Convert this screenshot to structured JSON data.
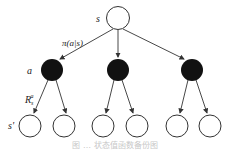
{
  "diagram": {
    "type": "backup-tree",
    "labels": {
      "root_state": "s",
      "policy_edge": "π(a|s)",
      "action": "a",
      "reward": "R",
      "reward_sub": "s",
      "reward_sup": "a",
      "next_state": "s'"
    },
    "caption": "图 … 状态值函数备份图",
    "colors": {
      "state_fill": "#ffffff",
      "action_fill": "#111111",
      "stroke": "#333333"
    },
    "nodes": {
      "root": {
        "kind": "state",
        "label": "s"
      },
      "actions": [
        {
          "kind": "action"
        },
        {
          "kind": "action"
        },
        {
          "kind": "action"
        }
      ],
      "next_states": [
        {
          "kind": "state"
        },
        {
          "kind": "state"
        },
        {
          "kind": "state"
        },
        {
          "kind": "state"
        },
        {
          "kind": "state"
        },
        {
          "kind": "state"
        }
      ]
    }
  }
}
